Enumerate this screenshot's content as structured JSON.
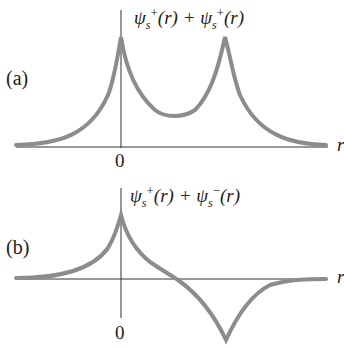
{
  "panels": [
    {
      "id": "a",
      "label": "(a)",
      "equation": {
        "psi1": "ψ",
        "sub1": "s",
        "sup1": "+",
        "arg1": "(r) +",
        "psi2": "ψ",
        "sub2": "s",
        "sup2": "+",
        "arg2": "(r)"
      },
      "origin_label": "0",
      "axis_label": "r"
    },
    {
      "id": "b",
      "label": "(b)",
      "equation": {
        "psi1": "ψ",
        "sub1": "s",
        "sup1": "+",
        "arg1": "(r) +",
        "psi2": "ψ",
        "sub2": "s",
        "sup2": "−",
        "arg2": "(r)"
      },
      "origin_label": "0",
      "axis_label": "r"
    }
  ],
  "colors": {
    "curve": "#8c8c8c",
    "axis": "#333333",
    "text": "#222222"
  }
}
